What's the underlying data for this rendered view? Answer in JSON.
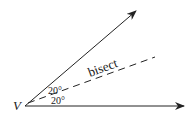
{
  "diagram": {
    "vertex_label": "V",
    "bisector_label": "bisect",
    "upper_angle_label": "20°",
    "lower_angle_label": "20°",
    "stroke_color": "#222222"
  }
}
